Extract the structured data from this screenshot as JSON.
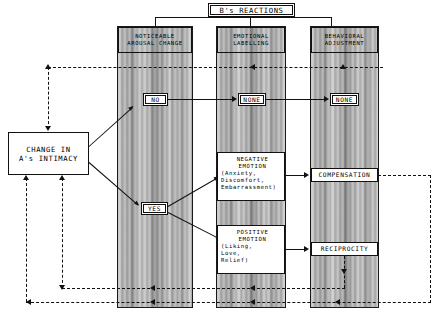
{
  "diagram": {
    "title": "B's REACTIONS",
    "source_box": {
      "line1": "CHANGE IN",
      "line2": "A's INTIMACY"
    },
    "columns": [
      {
        "id": "noticeable-arousal-change",
        "header_line1": "NOTICEABLE",
        "header_line2": "AROUSAL CHANGE"
      },
      {
        "id": "emotional-labelling",
        "header_line1": "EMOTIONAL",
        "header_line2": "LABELLING"
      },
      {
        "id": "behavioral-adjustment",
        "header_line1": "BEHAVIORAL",
        "header_line2": "ADJUSTMENT"
      }
    ],
    "nodes": {
      "decision_no": "NO",
      "decision_yes": "YES",
      "labelling_none": "NONE",
      "adjustment_none": "NONE",
      "negative_emotion": {
        "line1": "NEGATIVE",
        "line2": "EMOTION",
        "line3": "(Anxiety,",
        "line4": "Discomfort,",
        "line5": "Embarrassment)"
      },
      "positive_emotion": {
        "line1": "POSITIVE",
        "line2": "EMOTION",
        "line3": "(Liking,",
        "line4": "Love,",
        "line5": "Relief)"
      },
      "compensation": "COMPENSATION",
      "reciprocity": "RECIPROCITY"
    },
    "colors": {
      "ink": "#111111",
      "paper": "#ffffff",
      "panel_grey": "#b9b9b9"
    }
  }
}
